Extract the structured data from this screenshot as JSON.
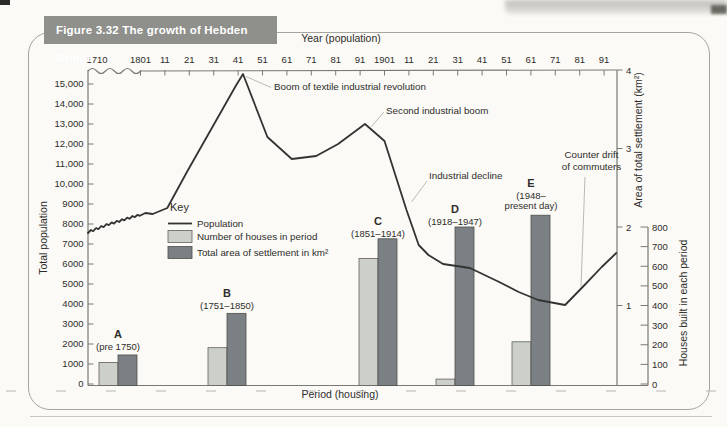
{
  "figure": {
    "title": "Figure 3.32  The growth of Hebden Bridge"
  },
  "colors": {
    "title_bar": "#8f8f8b",
    "light_bar": "#cdd0ca",
    "dark_bar": "#7b8084",
    "population_line": "#333331",
    "axis": "#7a7a75",
    "leader_line": "#b3b2ad"
  },
  "chart_data": {
    "type": "line+bar",
    "title": "The growth of Hebden Bridge",
    "top_axis": {
      "title": "Year (population)",
      "tick_labels": [
        "1710",
        "1801",
        "11",
        "21",
        "31",
        "41",
        "51",
        "61",
        "71",
        "81",
        "91",
        "1901",
        "11",
        "21",
        "31",
        "41",
        "51",
        "61",
        "71",
        "81",
        "91"
      ],
      "note": "wavy axis break between 1710 and 1801"
    },
    "left_axis": {
      "title": "Total population",
      "tick_labels": [
        "0",
        "1000",
        "2000",
        "3000",
        "4000",
        "5000",
        "6000",
        "7000",
        "8000",
        "9000",
        "10,000",
        "11,000",
        "12,000",
        "13,000",
        "14,000",
        "15,000"
      ],
      "range": [
        0,
        15000
      ]
    },
    "right_axis_area": {
      "title": "Area of total settlement (km²)",
      "tick_labels": [
        "1",
        "2",
        "3",
        "4"
      ],
      "range": [
        0,
        4
      ]
    },
    "right_axis_houses": {
      "title": "Houses built in each period",
      "tick_labels": [
        "0",
        "100",
        "200",
        "300",
        "400",
        "500",
        "600",
        "700",
        "800"
      ],
      "range": [
        0,
        800
      ]
    },
    "bottom_axis": {
      "title": "Period (housing)"
    },
    "key": {
      "title": "Key",
      "entries": [
        {
          "swatch": "line",
          "label": "Population"
        },
        {
          "swatch": "light-bar",
          "label": "Number of houses in period"
        },
        {
          "swatch": "dark-bar",
          "label": "Total area of settlement in km²"
        }
      ]
    },
    "categories": [
      {
        "letter": "A",
        "period_lines": [
          "(pre 1750)"
        ]
      },
      {
        "letter": "B",
        "period_lines": [
          "(1751–1850)"
        ]
      },
      {
        "letter": "C",
        "period_lines": [
          "(1851–1914)"
        ]
      },
      {
        "letter": "D",
        "period_lines": [
          "(1918–1947)"
        ]
      },
      {
        "letter": "E",
        "period_lines": [
          "(1948–",
          "present day)"
        ]
      }
    ],
    "series": [
      {
        "name": "Number of houses in period",
        "axis": "houses",
        "values": [
          110,
          185,
          640,
          25,
          215
        ]
      },
      {
        "name": "Total area of settlement in km²",
        "axis": "area",
        "values": [
          0.37,
          0.9,
          1.85,
          2.0,
          2.15
        ]
      },
      {
        "name": "Population",
        "axis": "population",
        "points": [
          [
            1710,
            7550
          ],
          [
            1715,
            7700
          ],
          [
            1719,
            7640
          ],
          [
            1724,
            7800
          ],
          [
            1728,
            7740
          ],
          [
            1733,
            7900
          ],
          [
            1737,
            7840
          ],
          [
            1742,
            8000
          ],
          [
            1746,
            7940
          ],
          [
            1751,
            8080
          ],
          [
            1755,
            8020
          ],
          [
            1760,
            8160
          ],
          [
            1764,
            8100
          ],
          [
            1769,
            8240
          ],
          [
            1773,
            8180
          ],
          [
            1778,
            8320
          ],
          [
            1782,
            8260
          ],
          [
            1787,
            8400
          ],
          [
            1791,
            8340
          ],
          [
            1796,
            8460
          ],
          [
            1800,
            8410
          ],
          [
            1803,
            8550
          ],
          [
            1806,
            8500
          ],
          [
            1809,
            8650
          ],
          [
            1812,
            8800
          ],
          [
            1820,
            10600
          ],
          [
            1830,
            12750
          ],
          [
            1840,
            14900
          ],
          [
            1843,
            15500
          ],
          [
            1853,
            12350
          ],
          [
            1863,
            11250
          ],
          [
            1873,
            11400
          ],
          [
            1882,
            12000
          ],
          [
            1893,
            13000
          ],
          [
            1901,
            12150
          ],
          [
            1910,
            8700
          ],
          [
            1915,
            6950
          ],
          [
            1919,
            6450
          ],
          [
            1925,
            6000
          ],
          [
            1936,
            5800
          ],
          [
            1948,
            5100
          ],
          [
            1956,
            4600
          ],
          [
            1964,
            4200
          ],
          [
            1975,
            3950
          ],
          [
            1983,
            4950
          ],
          [
            1990,
            5850
          ],
          [
            1996,
            6550
          ]
        ]
      }
    ],
    "annotations": {
      "boom": "Boom of textile industrial revolution",
      "second_boom": "Second industrial boom",
      "decline": "Industrial decline",
      "counter_drift_lines": [
        "Counter drift",
        "of commuters"
      ]
    }
  }
}
